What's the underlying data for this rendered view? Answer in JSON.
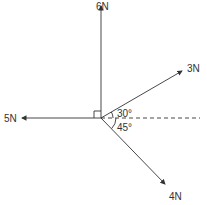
{
  "forces": [
    {
      "label": "6N",
      "direction": "up"
    },
    {
      "label": "5N",
      "direction": "left"
    },
    {
      "label": "3N",
      "direction": "30° above horizontal right"
    },
    {
      "label": "4N",
      "direction": "45° below horizontal right"
    }
  ],
  "angles": [
    {
      "label": "30°"
    },
    {
      "label": "45°"
    }
  ],
  "colors": {
    "line": "#333333",
    "background": "#ffffff"
  }
}
